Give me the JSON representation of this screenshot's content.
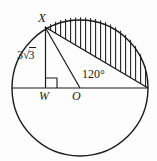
{
  "figure": {
    "background_color": "#fdfdfd",
    "stroke_color": "#1a1a1a",
    "labels": {
      "point_x": "X",
      "point_w": "W",
      "point_o": "O",
      "angle": "120°",
      "chord_length_prefix": "3",
      "chord_radical_sign": "√",
      "chord_radicand": "3",
      "chord_length_full": "3√3"
    },
    "geometry": {
      "circle": {
        "cx": 80,
        "cy": 88,
        "r": 68
      },
      "point_X": {
        "x": 45,
        "y": 27
      },
      "point_W": {
        "x": 46,
        "y": 88
      },
      "point_O": {
        "x": 80,
        "y": 88
      },
      "point_R": {
        "x": 148,
        "y": 88
      },
      "point_L": {
        "x": 12,
        "y": 88
      },
      "angle_at_O_degrees": 120,
      "right_angle_at_W": true,
      "hatch_spacing_px": 5,
      "hatch_orientation": "vertical",
      "shaded_region": "circular segment above chord X-R"
    }
  }
}
